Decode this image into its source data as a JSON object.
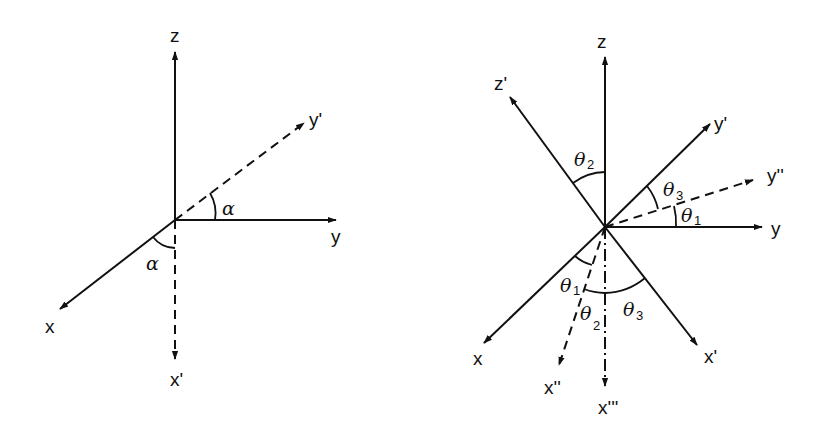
{
  "diagrams": [
    {
      "id": "left",
      "description": "Single rotation by angle alpha about z",
      "axes": {
        "z": "z",
        "y": "y",
        "x": "x",
        "y_prime": "y'",
        "x_prime": "x'"
      },
      "angles": {
        "upper": "α",
        "lower": "α"
      }
    },
    {
      "id": "right",
      "description": "Three successive rotations theta1, theta2, theta3",
      "axes": {
        "z": "z",
        "z_prime": "z'",
        "y_prime": "y'",
        "y_double_prime": "y''",
        "y": "y",
        "x": "x",
        "x_double_prime": "x''",
        "x_triple_prime": "x'''",
        "x_prime": "x'"
      },
      "angles": {
        "theta2_top": {
          "base": "θ",
          "sub": "2"
        },
        "theta3_right": {
          "base": "θ",
          "sub": "3"
        },
        "theta1_right": {
          "base": "θ",
          "sub": "1"
        },
        "theta1_bottom": {
          "base": "θ",
          "sub": "1"
        },
        "theta2_bottom": {
          "base": "θ",
          "sub": "2"
        },
        "theta3_bottom": {
          "base": "θ",
          "sub": "3"
        }
      }
    }
  ],
  "colors": {
    "ink": "#111111",
    "background": "#ffffff"
  }
}
